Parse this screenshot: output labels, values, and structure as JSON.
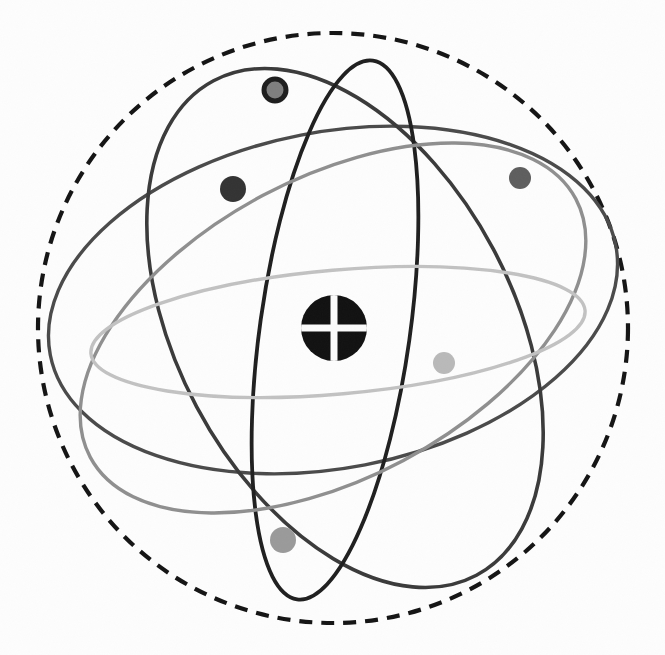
{
  "figure": {
    "name": "atom-model-diagram",
    "width": 665,
    "height": 655,
    "background_color": "#fdfdfd"
  },
  "boundary": {
    "name": "electron-cloud-boundary",
    "style": "dashed",
    "color": "#141414",
    "stroke_width": 4.2,
    "dash_pattern": "13 9",
    "cx": 333,
    "cy": 328,
    "r": 295
  },
  "nucleus": {
    "name": "nucleus",
    "cx": 334,
    "cy": 328,
    "r": 33,
    "fill_color": "#111111",
    "cross_color": "#fbfbfb",
    "cross_thickness": 7,
    "label": "nucleus"
  },
  "orbits": [
    {
      "id": "orbit-outer-tilted",
      "label": "outer tilted orbit",
      "color": "#4a4a4a",
      "stroke_width": 3.4,
      "cx": 333,
      "cy": 300,
      "rx": 288,
      "ry": 168,
      "rotation": -11
    },
    {
      "id": "orbit-large-slanted",
      "label": "large slanted orbit",
      "color": "#3a3a3a",
      "stroke_width": 3.6,
      "cx": 345,
      "cy": 328,
      "rx": 280,
      "ry": 168,
      "rotation": 62
    },
    {
      "id": "orbit-tall-narrow",
      "label": "tall narrow orbit",
      "color": "#1f1f1f",
      "stroke_width": 3.8,
      "cx": 335,
      "cy": 330,
      "rx": 75,
      "ry": 272,
      "rotation": 8
    },
    {
      "id": "orbit-gray-diagonal",
      "label": "gray diagonal orbit",
      "color": "#8f8f8f",
      "stroke_width": 3.4,
      "cx": 333,
      "cy": 328,
      "rx": 275,
      "ry": 150,
      "rotation": -28
    },
    {
      "id": "orbit-light-flat",
      "label": "light flat equatorial orbit",
      "color": "#c2c2c2",
      "stroke_width": 3.4,
      "cx": 338,
      "cy": 332,
      "rx": 248,
      "ry": 62,
      "rotation": -5
    }
  ],
  "electrons": [
    {
      "id": "electron-top-ring",
      "label": "top ring electron",
      "cx": 275,
      "cy": 90,
      "r": 11,
      "style": "ring",
      "fill_color": "#7e7e7e",
      "stroke_color": "#1d1d1d",
      "stroke_width": 5,
      "on_orbit": "orbit-tall-narrow"
    },
    {
      "id": "electron-upper-left",
      "label": "upper left electron",
      "cx": 233,
      "cy": 189,
      "r": 13,
      "style": "solid",
      "fill_color": "#333333",
      "stroke_color": "none",
      "stroke_width": 0,
      "on_orbit": "orbit-large-slanted"
    },
    {
      "id": "electron-right",
      "label": "right electron",
      "cx": 520,
      "cy": 178,
      "r": 11,
      "style": "solid",
      "fill_color": "#5e5e5e",
      "stroke_color": "none",
      "stroke_width": 0,
      "on_orbit": "orbit-outer-tilted"
    },
    {
      "id": "electron-right-inner",
      "label": "inner right electron",
      "cx": 444,
      "cy": 363,
      "r": 11,
      "style": "solid",
      "fill_color": "#b9b9b9",
      "stroke_color": "none",
      "stroke_width": 0,
      "on_orbit": "orbit-light-flat"
    },
    {
      "id": "electron-lower-left",
      "label": "lower left electron",
      "cx": 283,
      "cy": 540,
      "r": 13,
      "style": "solid",
      "fill_color": "#9a9a9a",
      "stroke_color": "none",
      "stroke_width": 0,
      "on_orbit": "orbit-gray-diagonal"
    }
  ]
}
